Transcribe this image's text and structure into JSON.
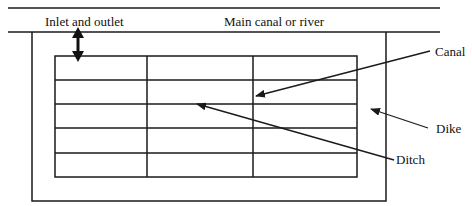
{
  "diagram": {
    "labels": {
      "inlet_outlet": "Inlet and outlet",
      "main_canal": "Main canal or river",
      "canal": "Canal",
      "dike": "Dike",
      "ditch": "Ditch"
    },
    "grid": {
      "rows": 5,
      "columns": 3
    },
    "colors": {
      "line": "#1a1a1a",
      "background": "#ffffff"
    }
  }
}
